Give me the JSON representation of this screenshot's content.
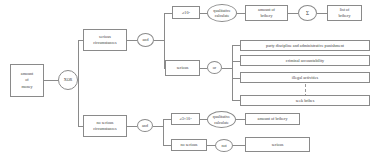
{
  "diagram": {
    "nodes": {
      "amount_of_money": "amount\nof\nmoney",
      "xor_gate": "XOR",
      "serious_circumstances": "serious\ncircumstances",
      "and_gate_top": "and",
      "threshold_top": "≥10⁴",
      "qualitative_calculate_top": "qualitative\ncalculate",
      "amount_of_bribery_top": "amount of\nbribery",
      "sum_gate": "Σ",
      "list_of_bribery": "list of\nbribery",
      "serious_top": "serious",
      "or_gate": "or",
      "party_discipline": "party discipline and administrative punishment",
      "criminal_accountability": "criminal accountability",
      "illegal_activities": "illegal activities",
      "seek_bribes": "seek bribes",
      "no_serious_circumstances": "no serious\ncircumstances",
      "and_gate_bottom": "and",
      "threshold_bottom": "≥3×10⁴",
      "qualitative_calculate_bottom": "qualitative\ncalculate",
      "amount_of_bribery_bottom": "amount of bribery",
      "no_serious": "no serious",
      "not_gate": "not",
      "serious_bottom": "serious"
    },
    "colors": {
      "stroke": "#8a8a8a",
      "text": "#3b3b3b",
      "background": "#ffffff"
    }
  }
}
